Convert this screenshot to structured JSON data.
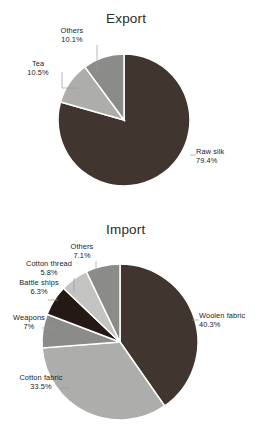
{
  "chart_data": [
    {
      "type": "pie",
      "title": "Export",
      "categories": [
        "Raw silk",
        "Tea",
        "Others"
      ],
      "values": [
        79.4,
        10.5,
        10.1
      ],
      "value_labels": [
        "79.4%",
        "10.5%",
        "10.1%"
      ],
      "colors": [
        "#413530",
        "#ADADAB",
        "#8B8B89"
      ],
      "start_angle_deg": 0,
      "direction": "clockwise",
      "legend": "none",
      "labels_position": "outside-leader",
      "xlabel": "",
      "ylabel": ""
    },
    {
      "type": "pie",
      "title": "Import",
      "categories": [
        "Woolen fabric",
        "Cotton fabric",
        "Weapons",
        "Battle ships",
        "Cotton thread",
        "Others"
      ],
      "values": [
        40.3,
        33.5,
        7.0,
        6.3,
        5.8,
        7.1
      ],
      "value_labels": [
        "40.3%",
        "33.5%",
        "7%",
        "6.3%",
        "5.8%",
        "7.1%"
      ],
      "colors": [
        "#413530",
        "#ADADAB",
        "#8B8B89",
        "#241915",
        "#C3C3C1",
        "#8B8B89"
      ],
      "start_angle_deg": 0,
      "direction": "clockwise",
      "legend": "none",
      "labels_position": "outside-leader",
      "xlabel": "",
      "ylabel": ""
    }
  ],
  "export_chart": {
    "title": "Export",
    "labels": [
      {
        "name": "Others",
        "value": "10.1%"
      },
      {
        "name": "Tea",
        "value": "10.5%"
      },
      {
        "name": "Raw silk",
        "value": "79.4%"
      }
    ]
  },
  "import_chart": {
    "title": "Import",
    "labels": [
      {
        "name": "Others",
        "value": "7.1%"
      },
      {
        "name": "Cotton thread",
        "value": "5.8%"
      },
      {
        "name": "Battle ships",
        "value": "6.3%"
      },
      {
        "name": "Weapons",
        "value": "7%"
      },
      {
        "name": "Cotton fabric",
        "value": "33.5%"
      },
      {
        "name": "Woolen fabric",
        "value": "40.3%"
      }
    ]
  }
}
